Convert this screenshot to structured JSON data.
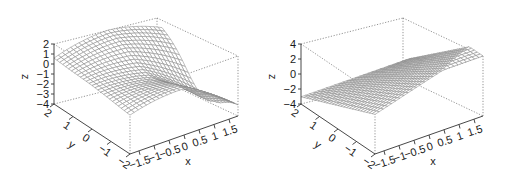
{
  "chart_data": [
    {
      "type": "surface3d",
      "title": "",
      "xlabel": "x",
      "ylabel": "y",
      "zlabel": "z",
      "x_ticks": [
        "-1.5",
        "-1",
        "-0.5",
        "0",
        "0.5",
        "1",
        "1.5"
      ],
      "y_ticks": [
        "2",
        "1",
        "0",
        "-1",
        "-2"
      ],
      "z_ticks": [
        "2",
        "1",
        "0",
        "-1",
        "-2",
        "-3",
        "-4"
      ],
      "xlim": [
        -1.8,
        1.8
      ],
      "ylim": [
        -2,
        2
      ],
      "zlim": [
        -4,
        2
      ],
      "grid_n": 26,
      "surface": "ridge",
      "mesh_color": "#8a8a8a",
      "box": {
        "top_left": [
          54,
          44
        ],
        "bottom_left": [
          54,
          104
        ],
        "front_bottom": [
          130,
          154
        ],
        "right_bottom": [
          238,
          116
        ],
        "back_top": [
          157,
          18
        ],
        "right_top": [
          242,
          53
        ]
      }
    },
    {
      "type": "surface3d",
      "title": "",
      "xlabel": "x",
      "ylabel": "y",
      "zlabel": "z",
      "x_ticks": [
        "-1.5",
        "-1",
        "-0.5",
        "0",
        "0.5",
        "1",
        "1.5"
      ],
      "y_ticks": [
        "2",
        "1",
        "0",
        "-1",
        "-2"
      ],
      "z_ticks": [
        "4",
        "2",
        "0",
        "-2",
        "-4"
      ],
      "xlim": [
        -1.8,
        1.8
      ],
      "ylim": [
        -2,
        2
      ],
      "zlim": [
        -4,
        4
      ],
      "grid_n": 26,
      "surface": "plane",
      "mesh_color": "#8a8a8a",
      "box": {
        "top_left": [
          301,
          44
        ],
        "bottom_left": [
          301,
          104
        ],
        "front_bottom": [
          375,
          154
        ],
        "right_bottom": [
          483,
          116
        ],
        "back_top": [
          403,
          18
        ],
        "right_top": [
          487,
          53
        ]
      }
    }
  ]
}
